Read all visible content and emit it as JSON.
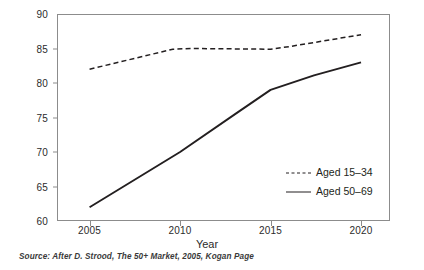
{
  "chart_data": {
    "type": "line",
    "title": "",
    "xlabel": "Year",
    "ylabel": "",
    "x": [
      2005,
      2010,
      2015,
      2020
    ],
    "xtick_labels": [
      "2005",
      "2010",
      "2015",
      "2020"
    ],
    "ytick_labels": [
      "60",
      "65",
      "70",
      "75",
      "80",
      "85",
      "90"
    ],
    "yticks": [
      60,
      65,
      70,
      75,
      80,
      85,
      90
    ],
    "xlim": [
      2003.2,
      2021.6
    ],
    "ylim": [
      60,
      90
    ],
    "grid": false,
    "legend_position": "inside lower-right",
    "series": [
      {
        "name": "Aged 15–34",
        "style": "dashed",
        "color": "#231f20",
        "values": [
          82,
          85,
          85,
          87
        ],
        "points": [
          {
            "x": 2005,
            "y": 82
          },
          {
            "x": 2009.6,
            "y": 84.9
          },
          {
            "x": 2010.6,
            "y": 85
          },
          {
            "x": 2015,
            "y": 84.9
          },
          {
            "x": 2016.1,
            "y": 85.3
          },
          {
            "x": 2020,
            "y": 87
          }
        ]
      },
      {
        "name": "Aged 50–69",
        "style": "solid",
        "color": "#231f20",
        "values": [
          62,
          70,
          79,
          83
        ],
        "points": [
          {
            "x": 2005,
            "y": 62
          },
          {
            "x": 2010,
            "y": 70
          },
          {
            "x": 2013.1,
            "y": 75.6
          },
          {
            "x": 2015,
            "y": 79
          },
          {
            "x": 2017.4,
            "y": 81.1
          },
          {
            "x": 2020,
            "y": 83
          }
        ]
      }
    ]
  },
  "legend": {
    "items": [
      {
        "label": "Aged 15–34",
        "style": "dashed"
      },
      {
        "label": "Aged 50–69",
        "style": "solid"
      }
    ]
  },
  "axis": {
    "x_title": "Year"
  },
  "caption": {
    "source": "Source:  After D. Strood, The 50+ Market,  2005, Kogan Page"
  },
  "colors": {
    "line": "#231f20",
    "frame": "#8c8c8c",
    "text": "#2b2b2b",
    "background": "#ffffff"
  }
}
